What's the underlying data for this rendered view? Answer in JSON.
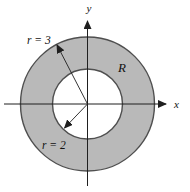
{
  "diagram": {
    "axis_labels": {
      "x": "x",
      "y": "y"
    },
    "region_label": "R",
    "radii": [
      {
        "label": "r = 3",
        "value": 3,
        "circle": "outer"
      },
      {
        "label": "r = 2",
        "value": 2,
        "circle": "inner"
      }
    ],
    "colors": {
      "region_fill": "#b9b9b9",
      "circle_stroke": "#4f4f4f",
      "axis_color": "#1f1f1f",
      "label_color": "#111111",
      "background": "#ffffff"
    }
  }
}
